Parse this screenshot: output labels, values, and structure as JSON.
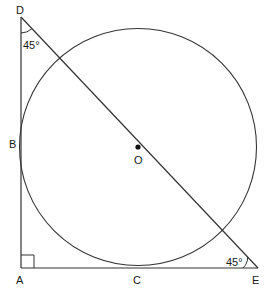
{
  "diagram": {
    "type": "geometry",
    "stroke_color": "#333333",
    "points": {
      "A": {
        "label": "A"
      },
      "B": {
        "label": "B"
      },
      "C": {
        "label": "C"
      },
      "D": {
        "label": "D"
      },
      "E": {
        "label": "E"
      },
      "O": {
        "label": "O"
      }
    },
    "angles": {
      "D": "45°",
      "E": "45°",
      "A": "right angle"
    },
    "angle_labels": {
      "D": "45°",
      "E": "45°"
    }
  }
}
